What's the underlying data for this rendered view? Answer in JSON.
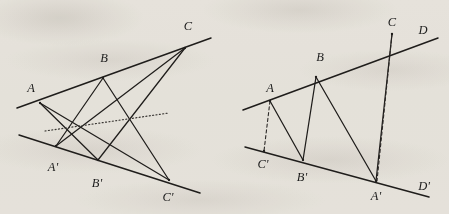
{
  "figure": {
    "background_color": "#f2f0ec",
    "ink_color": "#1f1d1b",
    "dotted_color": "#3a3734",
    "left_diagram": {
      "name": "pappus-hexagon-diagram",
      "upper_line": {
        "from": [
          17,
          108
        ],
        "to": [
          211,
          38
        ]
      },
      "lower_line": {
        "from": [
          19,
          135
        ],
        "to": [
          200,
          193
        ]
      },
      "points": [
        {
          "label": "A",
          "x": 40,
          "y": 103,
          "label_x": 31,
          "label_y": 88
        },
        {
          "label": "B",
          "x": 103,
          "y": 78,
          "label_x": 104,
          "label_y": 58
        },
        {
          "label": "C",
          "x": 185,
          "y": 48,
          "label_x": 188,
          "label_y": 26
        },
        {
          "label": "A'",
          "x": 56,
          "y": 146,
          "label_x": 53,
          "label_y": 167
        },
        {
          "label": "B'",
          "x": 98,
          "y": 160,
          "label_x": 97,
          "label_y": 183
        },
        {
          "label": "C'",
          "x": 169,
          "y": 180,
          "label_x": 168,
          "label_y": 197
        }
      ],
      "cross_segments": [
        [
          "A",
          "B'"
        ],
        [
          "A",
          "C'"
        ],
        [
          "B",
          "A'"
        ],
        [
          "B",
          "C'"
        ],
        [
          "C",
          "A'"
        ],
        [
          "C",
          "B'"
        ]
      ],
      "dotted_line": {
        "from": [
          45,
          131
        ],
        "to": [
          169,
          113
        ]
      }
    },
    "right_diagram": {
      "name": "projection-diagram",
      "upper_line": {
        "from": [
          243,
          110
        ],
        "to": [
          438,
          38
        ]
      },
      "lower_line": {
        "from": [
          245,
          147
        ],
        "to": [
          429,
          197
        ]
      },
      "upper_line_extra_label": "D",
      "lower_line_extra_label": "D'",
      "points": [
        {
          "label": "A",
          "x": 270,
          "y": 101,
          "label_x": 270,
          "label_y": 88
        },
        {
          "label": "B",
          "x": 316,
          "y": 77,
          "label_x": 320,
          "label_y": 57
        },
        {
          "label": "C",
          "x": 392,
          "y": 34,
          "label_x": 392,
          "label_y": 22
        },
        {
          "label": "D",
          "x": 438,
          "y": 38,
          "label_x": 423,
          "label_y": 30
        },
        {
          "label": "C'",
          "x": 264,
          "y": 151,
          "label_x": 263,
          "label_y": 164
        },
        {
          "label": "B'",
          "x": 303,
          "y": 160,
          "label_x": 302,
          "label_y": 177
        },
        {
          "label": "A'",
          "x": 376,
          "y": 181,
          "label_x": 376,
          "label_y": 196
        },
        {
          "label": "D'",
          "x": 429,
          "y": 197,
          "label_x": 424,
          "label_y": 186
        }
      ],
      "solid_segments": [
        [
          "A",
          "B'"
        ],
        [
          "B",
          "B'"
        ],
        [
          "B",
          "A'"
        ],
        [
          "C",
          "A'"
        ],
        [
          "A",
          "C'"
        ]
      ],
      "dashed_segments": [
        [
          "A",
          "C'"
        ],
        [
          "C",
          "A'"
        ]
      ]
    }
  }
}
